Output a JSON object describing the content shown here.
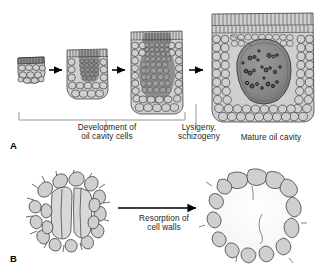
{
  "figure": {
    "background_color": "#ffffff",
    "line_color": "#2b2b2b",
    "cell_fill": "#cfcfcf",
    "dark_cell_fill": "#8c8c8c",
    "cavity_fill": "#8a8a8a",
    "droplet_color": "#111111",
    "bracket_color": "#8a8a8a",
    "arrow_color": "#000000"
  },
  "panel_a": {
    "letter": "A",
    "caption_development": "Development of\noil cavity cells",
    "caption_lysigeny": "Lysigeny,\nschizogeny",
    "caption_mature": "Mature oil cavity",
    "stages": [
      {
        "name": "stage-1-initial-cell-cluster",
        "order": 1
      },
      {
        "name": "stage-2-dividing-cells",
        "order": 2
      },
      {
        "name": "stage-3-dark-cell-mass",
        "order": 3
      },
      {
        "name": "stage-4-mature-oil-cavity",
        "order": 4
      }
    ],
    "arrows": 3,
    "bracket_spans_stages": "1-3"
  },
  "panel_b": {
    "letter": "B",
    "caption_resorption": "Resorption of\ncell walls",
    "stages": [
      {
        "name": "cells-with-intact-walls",
        "order": 1
      },
      {
        "name": "cavity-after-wall-resorption",
        "order": 2
      }
    ],
    "arrows": 1
  }
}
